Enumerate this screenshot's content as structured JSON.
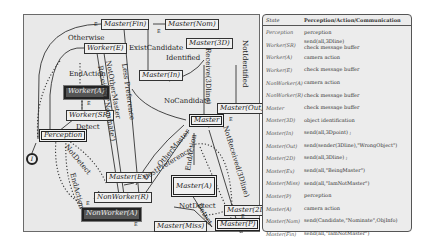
{
  "diagram": {
    "nodes": {
      "master_fin": "Master(Fin)",
      "master_nom": "Master(Nom)",
      "master_3d": "Master(3D)",
      "worker_e": "Worker(E)",
      "master_in": "Master(In)",
      "worker_a": "Worker(A)",
      "worker_sr": "Worker(SR)",
      "master_out": "Master(Out)",
      "master": "Master",
      "perception": "Perception",
      "master_ex": "Master(Ex)",
      "master_a": "Master(A)",
      "non_worker_r": "NonWorker(R)",
      "master_2d": "Master(2D)",
      "non_worker_a": "NonWorker(A)",
      "master_miss": "Master(Miss)",
      "master_p": "Master(P)",
      "initial": "I"
    },
    "edge_labels": {
      "otherwise": "Otherwise",
      "end_action_top": "EndAction",
      "detect": "Detect",
      "exist_candidate": "ExistCandidate",
      "identified": "Identified",
      "no_candidate": "NoCandidate",
      "not_identified": "NotIdentified",
      "receive_3dline": "Receive(3Dline)",
      "less_preference": "Less Preference",
      "not_other_master": "NotOtherMaster",
      "received_nominate": "Received('Nominate')",
      "other_master": "OtherMaster",
      "best_preference": "BestPreference",
      "end_action_master": "EndAction",
      "not_received_3dline": "NotReceived(3Dline)",
      "not_detect_left": "NotDetect",
      "end_action_left": "EndAction",
      "not_detect_bottom": "NotDetect",
      "detect_p": "Detect",
      "e1": "E",
      "e2": "E",
      "e3": "E",
      "e4": "E",
      "e5": "E",
      "e6": "E",
      "e7": "E"
    }
  },
  "table": {
    "header": {
      "state": "State",
      "action": "Perception/Action/Communication"
    },
    "rows": [
      {
        "state": "Perception",
        "action": "perception"
      },
      {
        "state": "Worker(SR)",
        "action": "send(all,3Dline)\ncheck message buffer"
      },
      {
        "state": "Worker(A)",
        "action": "camera action"
      },
      {
        "state": "Worker(E)",
        "action": "check message buffer"
      },
      {
        "state": "NonWorker(A)",
        "action": "camera action"
      },
      {
        "state": "NonWorker(R)",
        "action": "check message buffer"
      },
      {
        "state": "Master",
        "action": "check message buffer"
      },
      {
        "state": "Master(3D)",
        "action": "object identification"
      },
      {
        "state": "Master(In)",
        "action": "send(all,3Dpoint) ;"
      },
      {
        "state": "Master(Out)",
        "action": "send(sender(3Dline),\"WrongObject\")"
      },
      {
        "state": "Master(2D)",
        "action": "send(all,3Dline) ;"
      },
      {
        "state": "Master(Ex)",
        "action": "send(all,\"BeingMaster\")"
      },
      {
        "state": "Master(Miss)",
        "action": "send(all,\"IamNotMaster\")"
      },
      {
        "state": "Master(P)",
        "action": "perception"
      },
      {
        "state": "Master(A)",
        "action": "camera action"
      },
      {
        "state": "Master(Nom)",
        "action": "send(Candidate,\"Nominate\",ObjInfo)"
      },
      {
        "state": "Master(Fin)",
        "action": "send(all,\"IamNotMaster\")"
      }
    ]
  }
}
